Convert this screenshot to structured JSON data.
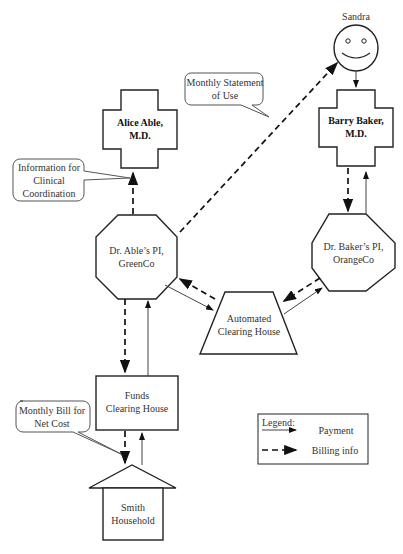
{
  "nodes": {
    "sandra": {
      "label": "Sandra"
    },
    "alice": {
      "line1": "Alice Able,",
      "line2": "M.D."
    },
    "barry": {
      "line1": "Barry Baker,",
      "line2": "M.D."
    },
    "able_pi": {
      "line1": "Dr. Able’s PI,",
      "line2": "GreenCo"
    },
    "baker_pi": {
      "line1": "Dr. Baker’s PI,",
      "line2": "OrangeCo"
    },
    "ach": {
      "line1": "Automated",
      "line2": "Clearing House"
    },
    "funds": {
      "line1": "Funds",
      "line2": "Clearing House"
    },
    "smith": {
      "line1": "Smith",
      "line2": "Household"
    }
  },
  "callouts": {
    "statement": {
      "line1": "Monthly Statement",
      "line2": "of Use"
    },
    "clinical": {
      "line1": "Information for",
      "line2": "Clinical",
      "line3": "Coordination"
    },
    "bill": {
      "line1": "Monthly Bill for",
      "line2": "Net Cost"
    }
  },
  "legend": {
    "title": "Legend:",
    "payment": "Payment",
    "billing": "Billing info"
  }
}
